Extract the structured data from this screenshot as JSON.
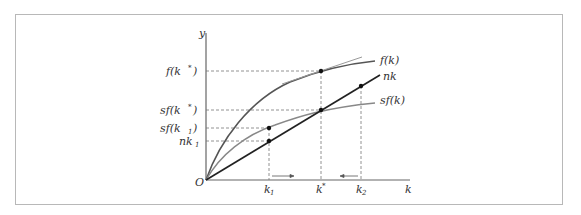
{
  "diagram": {
    "axes": {
      "x_label": "k",
      "y_label": "y",
      "origin_label": "O"
    },
    "curves": [
      {
        "id": "f",
        "label": "f(k)",
        "color": "#555555"
      },
      {
        "id": "nk",
        "label": "nk",
        "color": "#222222"
      },
      {
        "id": "sf",
        "label": "sf(k)",
        "color": "#888888"
      }
    ],
    "y_ticks": [
      {
        "label": "f(k*)",
        "main": "f(k",
        "sup": "*",
        "close": ")"
      },
      {
        "label": "sf(k*)",
        "main": "sf(k",
        "sup": "*",
        "close": ")"
      },
      {
        "label": "sf(k1)",
        "main": "sf(k",
        "sub": "1",
        "close": ")"
      },
      {
        "label": "nk1",
        "main": "nk",
        "sub": "1",
        "close": ""
      }
    ],
    "x_ticks": [
      {
        "label": "k1",
        "main": "k",
        "sub": "1"
      },
      {
        "label": "k*",
        "main": "k",
        "sup": "*"
      },
      {
        "label": "k2",
        "main": "k",
        "sub": "2"
      }
    ],
    "arrows": [
      {
        "from": "k1",
        "direction": "right"
      },
      {
        "from": "k2",
        "direction": "left"
      }
    ]
  }
}
